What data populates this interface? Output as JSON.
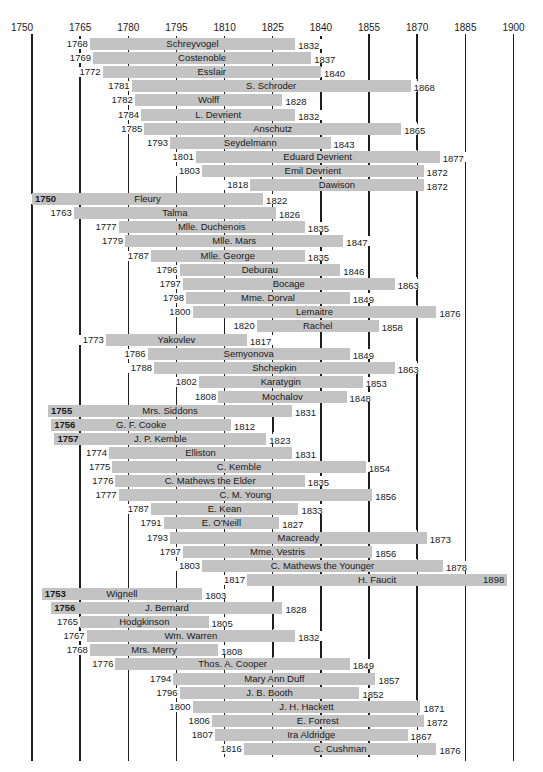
{
  "chart_data": {
    "type": "timeline",
    "title": "",
    "xlabel": "",
    "ylabel": "",
    "axis_ticks": [
      1750,
      1765,
      1780,
      1795,
      1810,
      1825,
      1840,
      1855,
      1870,
      1885,
      1900
    ],
    "xlim": [
      1750,
      1900
    ],
    "grid": true,
    "bar_color": "#c3c3c3",
    "rows": [
      {
        "name": "Schreyvogel",
        "start": 1768,
        "end": 1832
      },
      {
        "name": "Costenoble",
        "start": 1769,
        "end": 1837
      },
      {
        "name": "Esslair",
        "start": 1772,
        "end": 1840
      },
      {
        "name": "S. Schroder",
        "start": 1781,
        "end": 1868
      },
      {
        "name": "Wolff",
        "start": 1782,
        "end": 1828
      },
      {
        "name": "L. Devrient",
        "start": 1784,
        "end": 1832
      },
      {
        "name": "Anschutz",
        "start": 1785,
        "end": 1865
      },
      {
        "name": "Seydelmann",
        "start": 1793,
        "end": 1843
      },
      {
        "name": "Eduard Devrient",
        "start": 1801,
        "end": 1877
      },
      {
        "name": "Emil Devrient",
        "start": 1803,
        "end": 1872
      },
      {
        "name": "Dawison",
        "start": 1818,
        "end": 1872
      },
      {
        "name": "Fleury",
        "start": 1750,
        "end": 1822
      },
      {
        "name": "Talma",
        "start": 1763,
        "end": 1826
      },
      {
        "name": "Mlle. Duchenois",
        "start": 1777,
        "end": 1835
      },
      {
        "name": "Mlle. Mars",
        "start": 1779,
        "end": 1847
      },
      {
        "name": "Mlle. George",
        "start": 1787,
        "end": 1835
      },
      {
        "name": "Deburau",
        "start": 1796,
        "end": 1846
      },
      {
        "name": "Bocage",
        "start": 1797,
        "end": 1863
      },
      {
        "name": "Mme. Dorval",
        "start": 1798,
        "end": 1849
      },
      {
        "name": "Lemaitre",
        "start": 1800,
        "end": 1876
      },
      {
        "name": "Rachel",
        "start": 1820,
        "end": 1858
      },
      {
        "name": "Yakovlev",
        "start": 1773,
        "end": 1817
      },
      {
        "name": "Semyonova",
        "start": 1786,
        "end": 1849
      },
      {
        "name": "Shchepkin",
        "start": 1788,
        "end": 1863
      },
      {
        "name": "Karatygin",
        "start": 1802,
        "end": 1853
      },
      {
        "name": "Mochalov",
        "start": 1808,
        "end": 1848
      },
      {
        "name": "Mrs. Siddons",
        "start": 1755,
        "end": 1831
      },
      {
        "name": "G. F. Cooke",
        "start": 1756,
        "end": 1812
      },
      {
        "name": "J. P. Kemble",
        "start": 1757,
        "end": 1823
      },
      {
        "name": "Elliston",
        "start": 1774,
        "end": 1831
      },
      {
        "name": "C. Kemble",
        "start": 1775,
        "end": 1854
      },
      {
        "name": "C. Mathews the Elder",
        "start": 1776,
        "end": 1835
      },
      {
        "name": "C. M. Young",
        "start": 1777,
        "end": 1856
      },
      {
        "name": "E. Kean",
        "start": 1787,
        "end": 1833
      },
      {
        "name": "E. O'Neill",
        "start": 1791,
        "end": 1827
      },
      {
        "name": "Macready",
        "start": 1793,
        "end": 1873
      },
      {
        "name": "Mme. Vestris",
        "start": 1797,
        "end": 1856
      },
      {
        "name": "C. Mathews the Younger",
        "start": 1803,
        "end": 1878
      },
      {
        "name": "H. Faucit",
        "start": 1817,
        "end": 1898
      },
      {
        "name": "Wignell",
        "start": 1753,
        "end": 1803
      },
      {
        "name": "J. Bernard",
        "start": 1756,
        "end": 1828
      },
      {
        "name": "Hodgkinson",
        "start": 1765,
        "end": 1805
      },
      {
        "name": "Wm. Warren",
        "start": 1767,
        "end": 1832
      },
      {
        "name": "Mrs. Merry",
        "start": 1768,
        "end": 1808
      },
      {
        "name": "Thos. A. Cooper",
        "start": 1776,
        "end": 1849
      },
      {
        "name": "Mary Ann Duff",
        "start": 1794,
        "end": 1857
      },
      {
        "name": "J. B. Booth",
        "start": 1796,
        "end": 1852
      },
      {
        "name": "J. H. Hackett",
        "start": 1800,
        "end": 1871
      },
      {
        "name": "E. Forrest",
        "start": 1806,
        "end": 1872
      },
      {
        "name": "Ira Aldridge",
        "start": 1807,
        "end": 1867
      },
      {
        "name": "C. Cushman",
        "start": 1816,
        "end": 1876
      }
    ]
  },
  "axis": {
    "labels": [
      "1750",
      "1765",
      "1780",
      "1795",
      "1810",
      "1825",
      "1840",
      "1855",
      "1870",
      "1885",
      "1900"
    ]
  }
}
